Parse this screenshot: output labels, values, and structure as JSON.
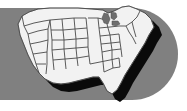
{
  "canvas": {
    "width": 187,
    "height": 111,
    "background_color": "#ffffff"
  },
  "band": {
    "label": "gray rounded banner bar",
    "color": "#808080",
    "left": -30,
    "top": 8,
    "width": 208,
    "height": 92,
    "corner_radius": 46,
    "rounded_side": "right"
  },
  "map": {
    "title": "United States",
    "region": "contiguous united states",
    "fill_color": "#f2f2f2",
    "border_color": "#6b6b6b",
    "outline_color": "#4a4a4a",
    "shadow_color": "#0a0a0a",
    "lake_color": "#6e6e6e",
    "shows_state_boundaries": true,
    "has_drop_shadow": true,
    "shadow_direction": "bottom-right",
    "notable_features": [
      "great-lakes",
      "florida-peninsula",
      "texas-gulf-coast",
      "new-england",
      "pacific-northwest"
    ]
  }
}
